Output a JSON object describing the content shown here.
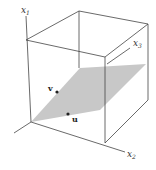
{
  "figure": {
    "type": "3d-plane-in-box",
    "axes": [
      {
        "name": "x1",
        "label": "x",
        "subscript": "1"
      },
      {
        "name": "x2",
        "label": "x",
        "subscript": "2"
      },
      {
        "name": "x3",
        "label": "x",
        "subscript": "3"
      }
    ],
    "vectors": [
      {
        "name": "v",
        "label": "v"
      },
      {
        "name": "u",
        "label": "u"
      }
    ],
    "colors": {
      "plane": "#c8c8c8",
      "edges": "#444444",
      "points": "#222222"
    }
  }
}
